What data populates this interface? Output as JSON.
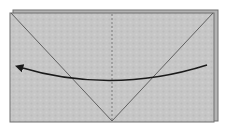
{
  "diagram": {
    "type": "origami-fold-step",
    "colors": {
      "paper": "#c4c4c4",
      "paper_back_layer": "#b0b0b0",
      "edge": "#6e6e6e",
      "crease": "#555555",
      "arrow": "#1a1a1a",
      "background": "#ffffff"
    },
    "elements": {
      "paper": "rectangle",
      "diagonal_creases": 2,
      "center_line": "dashed",
      "arrow": "curved, pointing left"
    }
  }
}
